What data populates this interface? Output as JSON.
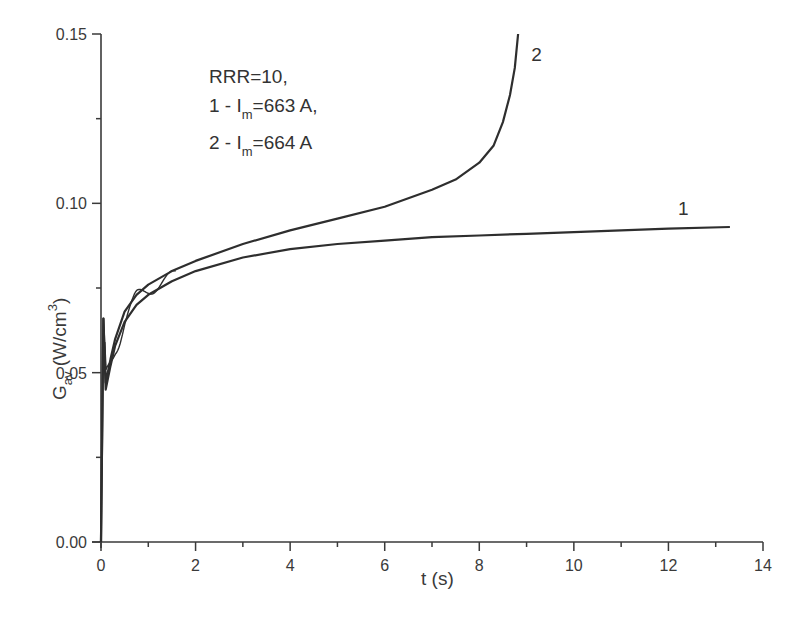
{
  "chart_data": {
    "type": "line",
    "title": "",
    "xlabel": "t (s)",
    "ylabel": "G_av (W/cm^3)",
    "ylabel_parts": {
      "main": "G",
      "sub": "av",
      "unit_open": " (W/cm",
      "sup": "3",
      "unit_close": ")"
    },
    "xlim": [
      0,
      14
    ],
    "ylim": [
      0.0,
      0.15
    ],
    "grid": false,
    "legend": "none (inline curve labels)",
    "x_ticks": [
      "0",
      "2",
      "4",
      "6",
      "8",
      "10",
      "12",
      "14"
    ],
    "y_ticks": [
      "0.00",
      "0.05",
      "0.10",
      "0.15"
    ],
    "annotation": {
      "line1": "RRR=10,",
      "line2_prefix": "1 - I",
      "line2_sub": "m",
      "line2_suffix": "=663 A,",
      "line3_prefix": "2 - I",
      "line3_sub": "m",
      "line3_suffix": "=664 A"
    },
    "series": [
      {
        "name": "1",
        "label": "1 - I_m=663 A",
        "x": [
          0.0,
          0.05,
          0.1,
          0.2,
          0.3,
          0.5,
          0.75,
          1.0,
          1.5,
          2.0,
          3.0,
          4.0,
          5.0,
          6.0,
          7.0,
          8.0,
          9.0,
          10.0,
          11.0,
          12.0,
          13.3
        ],
        "y": [
          0.0,
          0.066,
          0.045,
          0.052,
          0.058,
          0.065,
          0.07,
          0.073,
          0.077,
          0.08,
          0.084,
          0.0865,
          0.088,
          0.089,
          0.09,
          0.0905,
          0.091,
          0.0915,
          0.092,
          0.0925,
          0.093
        ]
      },
      {
        "name": "2",
        "label": "2 - I_m=664 A",
        "x": [
          0.0,
          0.05,
          0.1,
          0.2,
          0.3,
          0.5,
          0.75,
          1.0,
          1.5,
          2.0,
          3.0,
          4.0,
          5.0,
          6.0,
          7.0,
          7.5,
          8.0,
          8.3,
          8.5,
          8.65,
          8.75,
          8.82
        ],
        "y": [
          0.0,
          0.066,
          0.047,
          0.054,
          0.06,
          0.068,
          0.073,
          0.076,
          0.08,
          0.083,
          0.088,
          0.092,
          0.0955,
          0.099,
          0.104,
          0.107,
          0.112,
          0.117,
          0.124,
          0.132,
          0.14,
          0.15
        ]
      }
    ],
    "curve_labels": [
      {
        "text": "1",
        "x": 12.2,
        "y": 0.0965
      },
      {
        "text": "2",
        "x": 9.1,
        "y": 0.142
      }
    ]
  }
}
